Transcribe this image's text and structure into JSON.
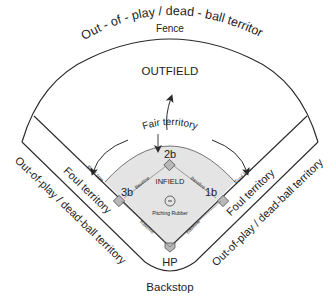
{
  "diagram": {
    "colors": {
      "line": "#2a2a2a",
      "infield_fill": "#e4e4e4",
      "base_fill": "#b8b8b8",
      "text": "#222222",
      "background": "#ffffff"
    },
    "labels": {
      "top_out_of_play": "Out - of - play / dead - ball territory",
      "fence": "Fence",
      "outfield": "OUTFIELD",
      "fair_territory": "Fair territory",
      "infield": "INFIELD",
      "pitching_rubber": "Pitching Rubber",
      "second_base": "2b",
      "third_base": "3b",
      "first_base": "1b",
      "home_plate": "HP",
      "baseline": "Baseline",
      "foul_line": "Foul line",
      "foul_territory": "Foul territory",
      "side_out_of_play": "Out-of-play / dead-ball territory",
      "backstop": "Backstop"
    },
    "nodes": [
      {
        "id": "second-base",
        "label": "2b"
      },
      {
        "id": "third-base",
        "label": "3b"
      },
      {
        "id": "first-base",
        "label": "1b"
      },
      {
        "id": "home-plate",
        "label": "HP"
      },
      {
        "id": "pitching-rubber",
        "label": "Pitching Rubber"
      }
    ]
  }
}
